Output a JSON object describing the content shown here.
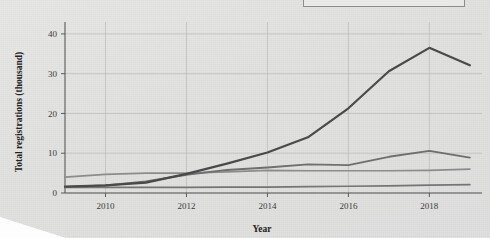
{
  "figure": {
    "background_color": "#e2e2e0",
    "has_cut_off_legend_box": true,
    "legend_box_label": ""
  },
  "chart_data": {
    "type": "line",
    "title": "",
    "xlabel": "Year",
    "ylabel": "Total registrations (thousand)",
    "x": [
      2009,
      2010,
      2011,
      2012,
      2013,
      2014,
      2015,
      2016,
      2017,
      2018,
      2019
    ],
    "xlim": [
      2009,
      2019.3
    ],
    "ylim": [
      0,
      43
    ],
    "xticks": [
      2010,
      2012,
      2014,
      2016,
      2018
    ],
    "xtick_labels": [
      "2010",
      "2012",
      "2014",
      "2016",
      "2018"
    ],
    "yticks": [
      0,
      10,
      20,
      30,
      40
    ],
    "ytick_labels": [
      "0",
      "10",
      "20",
      "30",
      "40"
    ],
    "grid": true,
    "legend_position": "top-right-cropped",
    "series": [
      {
        "name": "series-1",
        "color": "#4a4a4a",
        "width": 2.2,
        "values": [
          1.6,
          1.9,
          2.6,
          4.8,
          7.4,
          10.2,
          14.0,
          21.3,
          30.6,
          36.5,
          32.1
        ]
      },
      {
        "name": "series-2",
        "color": "#6f6f6f",
        "width": 1.9,
        "values": [
          1.5,
          1.9,
          2.9,
          4.6,
          5.8,
          6.4,
          7.2,
          7.0,
          9.1,
          10.6,
          8.9
        ]
      },
      {
        "name": "series-3",
        "color": "#8c8c8c",
        "width": 1.7,
        "values": [
          4.0,
          4.7,
          5.0,
          5.0,
          5.3,
          5.7,
          5.6,
          5.6,
          5.6,
          5.7,
          6.0
        ]
      },
      {
        "name": "series-4",
        "color": "#757575",
        "width": 1.7,
        "values": [
          1.4,
          1.4,
          1.4,
          1.4,
          1.5,
          1.5,
          1.6,
          1.7,
          1.8,
          2.0,
          2.1
        ]
      }
    ]
  }
}
